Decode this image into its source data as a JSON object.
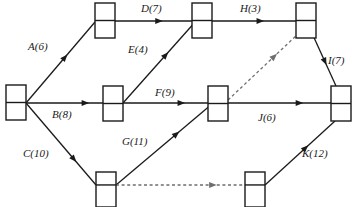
{
  "diagram": {
    "type": "activity-on-arrow-network",
    "title": "",
    "width": 352,
    "height": 207,
    "colors": {
      "stroke": "#1a1a1a",
      "dashed_stroke": "#6e6e6e",
      "background": "#ffffff"
    },
    "nodes": [
      {
        "id": "n1",
        "name": "start-node",
        "x": 6,
        "y": 85,
        "w": 20,
        "h": 35,
        "divider_ratio": 0.5
      },
      {
        "id": "n2",
        "name": "node-top-left",
        "x": 95,
        "y": 3,
        "w": 20,
        "h": 35,
        "divider_ratio": 0.5
      },
      {
        "id": "n3",
        "name": "node-middle-left",
        "x": 103,
        "y": 86,
        "w": 20,
        "h": 35,
        "divider_ratio": 0.5
      },
      {
        "id": "n4",
        "name": "node-bottom-left",
        "x": 96,
        "y": 172,
        "w": 20,
        "h": 35,
        "divider_ratio": 0.37
      },
      {
        "id": "n5",
        "name": "node-top-middle",
        "x": 192,
        "y": 3,
        "w": 20,
        "h": 35,
        "divider_ratio": 0.5
      },
      {
        "id": "n6",
        "name": "node-middle-center",
        "x": 208,
        "y": 86,
        "w": 20,
        "h": 35,
        "divider_ratio": 0.5
      },
      {
        "id": "n7",
        "name": "node-bottom-right",
        "x": 245,
        "y": 172,
        "w": 20,
        "h": 35,
        "divider_ratio": 0.37
      },
      {
        "id": "n8",
        "name": "node-top-right",
        "x": 296,
        "y": 3,
        "w": 20,
        "h": 35,
        "divider_ratio": 0.5
      },
      {
        "id": "n9",
        "name": "end-node",
        "x": 331,
        "y": 86,
        "w": 20,
        "h": 35,
        "divider_ratio": 0.5
      }
    ],
    "edges": [
      {
        "id": "A",
        "name": "edge-a",
        "label": "A(6)",
        "activity": "A",
        "duration": 6,
        "from": "n1",
        "to": "n2",
        "x1": 26,
        "y1": 103,
        "x2": 95,
        "y2": 22,
        "style": "solid",
        "label_x": 28,
        "label_y": 50,
        "arrow_t": 0.6
      },
      {
        "id": "B",
        "name": "edge-b",
        "label": "B(8)",
        "activity": "B",
        "duration": 8,
        "from": "n1",
        "to": "n3",
        "x1": 26,
        "y1": 103,
        "x2": 103,
        "y2": 103,
        "style": "solid",
        "label_x": 52,
        "label_y": 118,
        "arrow_t": 0.82
      },
      {
        "id": "C",
        "name": "edge-c",
        "label": "C(10)",
        "activity": "C",
        "duration": 10,
        "from": "n1",
        "to": "n4",
        "x1": 26,
        "y1": 103,
        "x2": 96,
        "y2": 185,
        "style": "solid",
        "label_x": 23,
        "label_y": 157,
        "arrow_t": 0.72
      },
      {
        "id": "D",
        "name": "edge-d",
        "label": "D(7)",
        "activity": "D",
        "duration": 7,
        "from": "n2",
        "to": "n5",
        "x1": 115,
        "y1": 21,
        "x2": 192,
        "y2": 21,
        "style": "solid",
        "label_x": 141,
        "label_y": 12,
        "arrow_t": 0.62
      },
      {
        "id": "E",
        "name": "edge-e",
        "label": "E(4)",
        "activity": "E",
        "duration": 4,
        "from": "n3",
        "to": "n5",
        "x1": 123,
        "y1": 103,
        "x2": 196,
        "y2": 21,
        "style": "solid",
        "label_x": 128,
        "label_y": 53,
        "arrow_t": 0.62
      },
      {
        "id": "F",
        "name": "edge-f",
        "label": "F(9)",
        "activity": "F",
        "duration": 9,
        "from": "n3",
        "to": "n6",
        "x1": 123,
        "y1": 103,
        "x2": 208,
        "y2": 103,
        "style": "solid",
        "label_x": 155,
        "label_y": 96,
        "arrow_t": 0.73
      },
      {
        "id": "G",
        "name": "edge-g",
        "label": "G(11)",
        "activity": "G",
        "duration": 11,
        "from": "n4",
        "to": "n6",
        "x1": 116,
        "y1": 185,
        "x2": 212,
        "y2": 104,
        "style": "solid",
        "label_x": 122,
        "label_y": 145,
        "arrow_t": 0.66
      },
      {
        "id": "H",
        "name": "edge-h",
        "label": "H(3)",
        "activity": "H",
        "duration": 3,
        "from": "n5",
        "to": "n8",
        "x1": 212,
        "y1": 21,
        "x2": 296,
        "y2": 21,
        "style": "solid",
        "label_x": 240,
        "label_y": 12,
        "arrow_t": 0.62
      },
      {
        "id": "I",
        "name": "edge-i",
        "label": "I(7)",
        "activity": "I",
        "duration": 7,
        "from": "n8",
        "to": "n9",
        "x1": 311,
        "y1": 31,
        "x2": 336,
        "y2": 86,
        "style": "solid",
        "label_x": 328,
        "label_y": 64,
        "arrow_t": 0.62
      },
      {
        "id": "J",
        "name": "edge-j",
        "label": "J(6)",
        "activity": "J",
        "duration": 6,
        "from": "n6",
        "to": "n9",
        "x1": 228,
        "y1": 103,
        "x2": 331,
        "y2": 103,
        "style": "solid",
        "label_x": 258,
        "label_y": 121,
        "arrow_t": 0.73
      },
      {
        "id": "K",
        "name": "edge-k",
        "label": "K(12)",
        "activity": "K",
        "duration": 12,
        "from": "n7",
        "to": "n9",
        "x1": 265,
        "y1": 185,
        "x2": 335,
        "y2": 121,
        "style": "solid",
        "label_x": 302,
        "label_y": 157,
        "arrow_t": 0.62
      },
      {
        "id": "D1",
        "name": "edge-dummy-1",
        "label": "",
        "activity": "dummy",
        "duration": 0,
        "from": "n6",
        "to": "n8",
        "x1": 228,
        "y1": 100,
        "x2": 298,
        "y2": 34,
        "style": "dashed",
        "label_x": 0,
        "label_y": 0,
        "arrow_t": 0.7
      },
      {
        "id": "D2",
        "name": "edge-dummy-2",
        "label": "",
        "activity": "dummy",
        "duration": 0,
        "from": "n4",
        "to": "n7",
        "x1": 116,
        "y1": 185,
        "x2": 245,
        "y2": 185,
        "style": "dashed",
        "label_x": 0,
        "label_y": 0,
        "arrow_t": 0.78
      }
    ]
  }
}
